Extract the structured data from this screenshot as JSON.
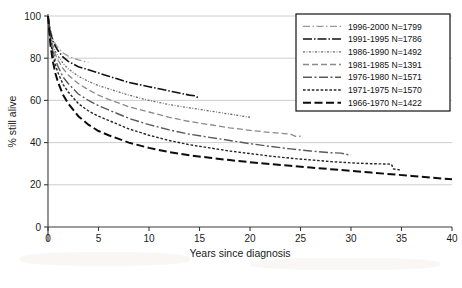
{
  "chart_data": {
    "type": "line",
    "title": "",
    "xlabel": "Years since diagnosis",
    "ylabel": "% still alive",
    "xlim": [
      0,
      40
    ],
    "ylim": [
      0,
      100
    ],
    "xticks": [
      0,
      5,
      10,
      15,
      20,
      25,
      30,
      35,
      40
    ],
    "yticks": [
      0,
      20,
      40,
      60,
      80,
      100
    ],
    "grid": "horizontal",
    "legend_position": "top-right",
    "series": [
      {
        "name": "1996-2000 N=1799",
        "label": "1996-2000",
        "n": 1799,
        "color": "#9b9b9b",
        "dash": "7,2.5,1.5,2.5",
        "width": 1.3,
        "x": [
          0,
          0.25,
          0.5,
          0.75,
          1,
          1.5,
          2,
          2.5,
          3,
          3.5,
          4
        ],
        "y": [
          100,
          93,
          89,
          86.5,
          85,
          82.5,
          81,
          80,
          79.2,
          78.6,
          78
        ]
      },
      {
        "name": "1991-1995 N=1786",
        "label": "1991-1995",
        "n": 1786,
        "color": "#111111",
        "dash": "9,2,1.5,2",
        "width": 1.6,
        "x": [
          0,
          0.25,
          0.5,
          0.75,
          1,
          1.5,
          2,
          3,
          4,
          5,
          6,
          7,
          8,
          9,
          10,
          11,
          12,
          13,
          14,
          14.5,
          15
        ],
        "y": [
          100,
          92,
          88,
          85.5,
          83.5,
          80.5,
          78.5,
          76,
          74.5,
          73,
          71.5,
          70,
          68.5,
          67.5,
          66.5,
          65.5,
          64.5,
          63.5,
          62.5,
          62.2,
          61
        ]
      },
      {
        "name": "1986-1990 N=1492",
        "label": "1986-1990",
        "n": 1492,
        "color": "#6a6a6a",
        "dash": "2,1.6,0.8,1.6",
        "width": 1.3,
        "x": [
          0,
          0.25,
          0.5,
          0.75,
          1,
          1.5,
          2,
          3,
          4,
          5,
          6,
          8,
          10,
          12,
          14,
          16,
          18,
          20
        ],
        "y": [
          100,
          91,
          86,
          83,
          81,
          77.5,
          75,
          71.5,
          69,
          67,
          65.5,
          62.5,
          60,
          58,
          56.5,
          55,
          53.5,
          52
        ]
      },
      {
        "name": "1981-1985 N=1391",
        "label": "1981-1985",
        "n": 1391,
        "color": "#8a8a8a",
        "dash": "6,3",
        "width": 1.3,
        "x": [
          0,
          0.25,
          0.5,
          0.75,
          1,
          1.5,
          2,
          3,
          4,
          5,
          6,
          8,
          10,
          12,
          14,
          16,
          18,
          20,
          22,
          24,
          24.5,
          25
        ],
        "y": [
          100,
          90,
          85,
          81.5,
          79,
          75,
          72,
          68,
          65,
          62.5,
          60.5,
          57,
          54.5,
          52,
          50,
          48.5,
          47,
          45.8,
          44.8,
          44,
          43,
          43
        ]
      },
      {
        "name": "1976-1980 N=1571",
        "label": "1976-1980",
        "n": 1571,
        "color": "#5a5a5a",
        "dash": "9,2.5,2,2.5",
        "width": 1.4,
        "x": [
          0,
          0.25,
          0.5,
          0.75,
          1,
          1.5,
          2,
          3,
          4,
          5,
          6,
          8,
          10,
          12,
          14,
          16,
          18,
          20,
          22,
          24,
          26,
          28,
          29,
          30
        ],
        "y": [
          100,
          89,
          83,
          79,
          76,
          71,
          68,
          63,
          60,
          57.5,
          55.5,
          51.5,
          48.5,
          46,
          44,
          42.5,
          41,
          39.5,
          38.2,
          37,
          36,
          35.2,
          35,
          34
        ]
      },
      {
        "name": "1971-1975 N=1570",
        "label": "1971-1975",
        "n": 1570,
        "color": "#262626",
        "dash": "2.6,1.8",
        "width": 1.4,
        "x": [
          0,
          0.25,
          0.5,
          0.75,
          1,
          1.5,
          2,
          3,
          4,
          5,
          6,
          8,
          10,
          12,
          14,
          16,
          18,
          20,
          22,
          24,
          26,
          28,
          30,
          32,
          34,
          34.2,
          35
        ],
        "y": [
          100,
          88,
          81,
          76.5,
          73,
          67.5,
          64,
          58.5,
          55,
          52.5,
          50.5,
          46.5,
          43.5,
          41,
          39,
          37.5,
          36,
          34.8,
          33.6,
          32.6,
          31.8,
          31,
          30.4,
          30,
          29.8,
          27.5,
          27
        ]
      },
      {
        "name": "1966-1970 N=1422",
        "label": "1966-1970",
        "n": 1422,
        "color": "#0d0d0d",
        "dash": "8,3.5",
        "width": 2.0,
        "x": [
          0,
          0.25,
          0.5,
          0.75,
          1,
          1.5,
          2,
          3,
          4,
          5,
          6,
          8,
          10,
          12,
          14,
          16,
          18,
          20,
          22,
          24,
          26,
          28,
          30,
          32,
          34,
          36,
          38,
          39,
          40
        ],
        "y": [
          100,
          86,
          78,
          72.5,
          68.5,
          62.5,
          58.5,
          52.5,
          48.5,
          45.5,
          43.5,
          40,
          37.5,
          35.5,
          34,
          32.8,
          31.7,
          30.7,
          29.8,
          29,
          28.2,
          27.4,
          26.6,
          25.8,
          25,
          24.2,
          23.4,
          23,
          22.6
        ]
      }
    ]
  },
  "legend": {
    "items": [
      {
        "label": "1996-2000 N=1799"
      },
      {
        "label": "1991-1995 N=1786"
      },
      {
        "label": "1986-1990 N=1492"
      },
      {
        "label": "1981-1985 N=1391"
      },
      {
        "label": "1976-1980 N=1571"
      },
      {
        "label": "1971-1975 N=1570"
      },
      {
        "label": "1966-1970 N=1422"
      }
    ]
  },
  "axes": {
    "y_title": "% still alive",
    "x_title": "Years since diagnosis",
    "ytick_labels": [
      "0",
      "20",
      "40",
      "60",
      "80",
      "100"
    ],
    "xtick_labels": [
      "0",
      "5",
      "10",
      "15",
      "20",
      "25",
      "30",
      "35",
      "40"
    ]
  }
}
